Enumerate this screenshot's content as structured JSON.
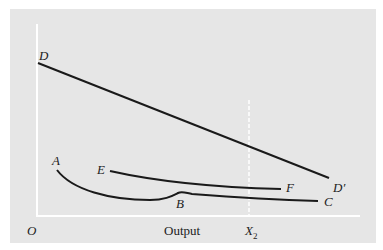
{
  "diagram": {
    "colors": {
      "background": "#ffffff",
      "panel": "#e6e6e6",
      "axis": "#ffffff",
      "curve": "#1a1a1a",
      "label": "#222222"
    },
    "axes": {
      "origin_label": "O",
      "x_axis_label": "Output",
      "x_marker_label": "X",
      "x_marker_subscript": "2"
    },
    "curves": [
      {
        "id": "DD'",
        "start_label": "D",
        "end_label": "D'",
        "shape": "straight downward-sloping line"
      },
      {
        "id": "ABC",
        "start_label": "A",
        "kink_label": "B",
        "end_label": "C",
        "shape": "declining curve with small bump at B, then flat"
      },
      {
        "id": "EF",
        "start_label": "E",
        "end_label": "F",
        "shape": "gently declining curve"
      }
    ],
    "labels": {
      "D": "D",
      "D_prime": "D′",
      "A": "A",
      "B": "B",
      "C": "C",
      "E": "E",
      "F": "F"
    }
  }
}
